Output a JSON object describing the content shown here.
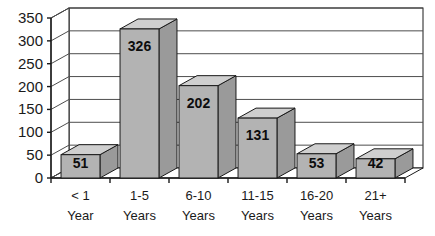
{
  "chart_data": {
    "type": "bar",
    "title": "",
    "subtitle": "",
    "xlabel": "",
    "ylabel": "",
    "categories": [
      "< 1 Year",
      "1-5 Years",
      "6-10 Years",
      "11-15 Years",
      "16-20 Years",
      "21+ Years"
    ],
    "category_lines": [
      [
        "< 1",
        "Year"
      ],
      [
        "1-5",
        "Years"
      ],
      [
        "6-10",
        "Years"
      ],
      [
        "11-15",
        "Years"
      ],
      [
        "16-20",
        "Years"
      ],
      [
        "21+",
        "Years"
      ]
    ],
    "values": [
      51,
      326,
      202,
      131,
      53,
      42
    ],
    "data_labels": [
      "51",
      "326",
      "202",
      "131",
      "53",
      "42"
    ],
    "ylim": [
      0,
      350
    ],
    "ytick_values": [
      0,
      50,
      100,
      150,
      200,
      250,
      300,
      350
    ],
    "ytick_labels": [
      "0",
      "50",
      "100",
      "150",
      "200",
      "250",
      "300",
      "350"
    ],
    "grid": true,
    "grid_orientation": "horizontal",
    "legend": false,
    "legend_position": "none",
    "style": "3d-column",
    "colors": {
      "bar_front": "#b3b3b3",
      "bar_top": "#cfcfcf",
      "bar_side": "#9a9a9a",
      "bar_outline": "#1a1a1a",
      "axis": "#1a1a1a",
      "grid": "#4d4d4d",
      "background": "#ffffff",
      "text": "#1a1a1a"
    }
  }
}
